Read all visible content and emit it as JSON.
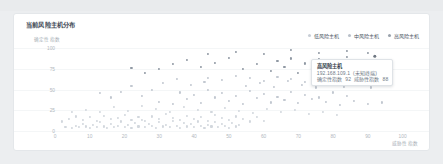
{
  "card": {
    "title": "当前风险主机分布"
  },
  "legend": [
    {
      "label": "低风险主机",
      "color": "#c8ced6",
      "marker": "low-risk-marker"
    },
    {
      "label": "中风险主机",
      "color": "#b9c0c9",
      "marker": "medium-risk-marker"
    },
    {
      "label": "高风险主机",
      "color": "#9aa2ac",
      "marker": "high-risk-marker"
    }
  ],
  "tooltip": {
    "title": "高风险主机",
    "ip": "192.168.109.1",
    "ip_suffix": "(未知终端)",
    "metric1_label": "确定性指数",
    "metric1_value": "92",
    "metric2_label": "威胁性指数",
    "metric2_value": "88"
  },
  "chart_data": {
    "type": "scatter",
    "title": "当前风险主机分布",
    "xlabel": "威胁性指数",
    "ylabel": "确定性指数",
    "xlim": [
      0,
      105
    ],
    "ylim": [
      0,
      105
    ],
    "xticks": [
      0,
      10,
      20,
      30,
      40,
      50,
      60,
      70,
      80,
      90,
      100
    ],
    "yticks": [
      0,
      25,
      50,
      75,
      100
    ],
    "grid": true,
    "legend_position": "top-right",
    "series": [
      {
        "name": "低风险主机",
        "color": "#d2d7dd",
        "points": [
          [
            3,
            2
          ],
          [
            5,
            1
          ],
          [
            6,
            4
          ],
          [
            7,
            2
          ],
          [
            8,
            6
          ],
          [
            9,
            3
          ],
          [
            10,
            1
          ],
          [
            11,
            5
          ],
          [
            12,
            2
          ],
          [
            13,
            8
          ],
          [
            14,
            3
          ],
          [
            15,
            1
          ],
          [
            16,
            6
          ],
          [
            17,
            2
          ],
          [
            18,
            4
          ],
          [
            19,
            9
          ],
          [
            20,
            2
          ],
          [
            21,
            5
          ],
          [
            22,
            1
          ],
          [
            23,
            7
          ],
          [
            24,
            3
          ],
          [
            25,
            11
          ],
          [
            26,
            2
          ],
          [
            27,
            6
          ],
          [
            28,
            4
          ],
          [
            29,
            1
          ],
          [
            30,
            8
          ],
          [
            31,
            3
          ],
          [
            32,
            5
          ],
          [
            33,
            2
          ],
          [
            34,
            10
          ],
          [
            35,
            4
          ],
          [
            36,
            1
          ],
          [
            37,
            7
          ],
          [
            38,
            3
          ],
          [
            39,
            6
          ],
          [
            40,
            2
          ],
          [
            41,
            9
          ],
          [
            42,
            4
          ],
          [
            43,
            1
          ],
          [
            44,
            5
          ],
          [
            45,
            3
          ],
          [
            46,
            8
          ],
          [
            47,
            2
          ],
          [
            48,
            6
          ],
          [
            49,
            4
          ],
          [
            50,
            1
          ],
          [
            51,
            7
          ],
          [
            52,
            3
          ],
          [
            53,
            5
          ],
          [
            2,
            9
          ],
          [
            4,
            12
          ],
          [
            6,
            15
          ],
          [
            8,
            11
          ],
          [
            10,
            14
          ],
          [
            12,
            10
          ],
          [
            14,
            16
          ],
          [
            16,
            12
          ],
          [
            18,
            13
          ],
          [
            20,
            17
          ],
          [
            22,
            11
          ],
          [
            24,
            14
          ],
          [
            26,
            10
          ],
          [
            28,
            15
          ],
          [
            30,
            12
          ],
          [
            32,
            18
          ],
          [
            34,
            13
          ],
          [
            36,
            11
          ],
          [
            38,
            16
          ],
          [
            40,
            12
          ],
          [
            42,
            14
          ],
          [
            44,
            10
          ],
          [
            46,
            17
          ],
          [
            48,
            13
          ],
          [
            50,
            11
          ],
          [
            52,
            15
          ],
          [
            54,
            12
          ],
          [
            56,
            9
          ],
          [
            58,
            14
          ],
          [
            60,
            10
          ],
          [
            5,
            20
          ],
          [
            9,
            23
          ],
          [
            13,
            21
          ],
          [
            17,
            26
          ],
          [
            21,
            22
          ],
          [
            25,
            28
          ],
          [
            29,
            24
          ],
          [
            33,
            20
          ],
          [
            37,
            27
          ],
          [
            41,
            23
          ],
          [
            45,
            21
          ],
          [
            49,
            25
          ],
          [
            53,
            22
          ],
          [
            57,
            19
          ],
          [
            61,
            24
          ],
          [
            65,
            20
          ],
          [
            69,
            23
          ],
          [
            73,
            18
          ],
          [
            77,
            21
          ],
          [
            81,
            17
          ]
        ]
      },
      {
        "name": "中风险主机",
        "color": "#c2c8d0",
        "points": [
          [
            30,
            33
          ],
          [
            34,
            30
          ],
          [
            38,
            36
          ],
          [
            42,
            31
          ],
          [
            46,
            38
          ],
          [
            50,
            34
          ],
          [
            54,
            30
          ],
          [
            58,
            37
          ],
          [
            62,
            32
          ],
          [
            66,
            35
          ],
          [
            70,
            31
          ],
          [
            74,
            36
          ],
          [
            78,
            33
          ],
          [
            82,
            29
          ],
          [
            86,
            34
          ],
          [
            90,
            30
          ],
          [
            94,
            32
          ],
          [
            36,
            44
          ],
          [
            40,
            41
          ],
          [
            44,
            47
          ],
          [
            48,
            43
          ],
          [
            52,
            40
          ],
          [
            56,
            46
          ],
          [
            60,
            42
          ],
          [
            64,
            39
          ],
          [
            68,
            45
          ],
          [
            72,
            41
          ],
          [
            76,
            38
          ],
          [
            80,
            44
          ],
          [
            84,
            40
          ],
          [
            55,
            52
          ],
          [
            59,
            56
          ],
          [
            63,
            51
          ],
          [
            67,
            58
          ],
          [
            71,
            53
          ],
          [
            75,
            50
          ],
          [
            79,
            55
          ],
          [
            83,
            51
          ],
          [
            87,
            54
          ],
          [
            91,
            50
          ],
          [
            44,
            62
          ],
          [
            48,
            59
          ],
          [
            52,
            64
          ],
          [
            56,
            61
          ],
          [
            60,
            58
          ],
          [
            64,
            63
          ],
          [
            68,
            60
          ],
          [
            72,
            57
          ],
          [
            76,
            62
          ],
          [
            80,
            59
          ],
          [
            25,
            40
          ],
          [
            28,
            47
          ],
          [
            22,
            52
          ],
          [
            19,
            45
          ],
          [
            16,
            38
          ],
          [
            13,
            43
          ],
          [
            31,
            55
          ],
          [
            35,
            60
          ],
          [
            39,
            53
          ],
          [
            43,
            57
          ]
        ]
      },
      {
        "name": "高风险主机",
        "color": "#8f98a3",
        "points": [
          [
            62,
            70
          ],
          [
            66,
            75
          ],
          [
            70,
            68
          ],
          [
            74,
            73
          ],
          [
            78,
            71
          ],
          [
            82,
            76
          ],
          [
            86,
            69
          ],
          [
            90,
            74
          ],
          [
            94,
            70
          ],
          [
            58,
            78
          ],
          [
            64,
            82
          ],
          [
            68,
            85
          ],
          [
            72,
            79
          ],
          [
            76,
            84
          ],
          [
            80,
            80
          ],
          [
            84,
            87
          ],
          [
            88,
            81
          ],
          [
            92,
            83
          ],
          [
            96,
            78
          ],
          [
            54,
            72
          ],
          [
            46,
            80
          ],
          [
            50,
            86
          ],
          [
            42,
            75
          ],
          [
            38,
            83
          ],
          [
            34,
            78
          ],
          [
            30,
            72
          ],
          [
            26,
            68
          ],
          [
            22,
            74
          ],
          [
            44,
            90
          ],
          [
            52,
            93
          ],
          [
            60,
            91
          ],
          [
            68,
            95
          ],
          [
            76,
            92
          ],
          [
            84,
            94
          ],
          [
            90,
            92
          ],
          [
            92,
            88
          ]
        ]
      }
    ],
    "highlighted_point": {
      "x": 92,
      "y": 88,
      "series": "高风险主机",
      "color": "#6f7782"
    }
  }
}
